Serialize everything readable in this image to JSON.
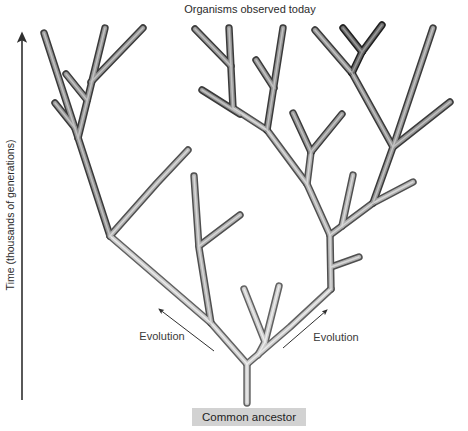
{
  "title": "Organisms observed today",
  "axis_label": "Time (thousands of generations)",
  "labels": {
    "evolution_left": "Evolution",
    "evolution_right": "Evolution",
    "common_ancestor": "Common ancestor"
  },
  "colors": {
    "background": "#ffffff",
    "text": "#2b2b2b",
    "arrow": "#2f2f2f",
    "ancestor_box_bg": "#d2d2d2",
    "tone_outline": [
      "#616161",
      "#4f4f4f",
      "#3a3a3a",
      "#1f1f1f"
    ],
    "tone_fill": [
      "#cccccc",
      "#b2b2b2",
      "#979797",
      "#6a6a6a"
    ],
    "tone_highlight": [
      "#ebebeb",
      "#d8d8d8",
      "#c2c2c2",
      "#9a9a9a"
    ]
  },
  "tree": {
    "segments": [
      {
        "name": "trunk",
        "tone": 0,
        "pts": [
          [
            247,
            403
          ],
          [
            247,
            364
          ]
        ]
      },
      {
        "name": "left-main-branch",
        "tone": 0,
        "pts": [
          [
            247,
            364
          ],
          [
            211,
            323
          ],
          [
            110,
            236
          ]
        ]
      },
      {
        "name": "left-vertical-branch",
        "tone": 1,
        "pts": [
          [
            211,
            323
          ],
          [
            199,
            248
          ],
          [
            194,
            176
          ]
        ]
      },
      {
        "name": "left-vertical-stub",
        "tone": 1,
        "pts": [
          [
            199,
            246
          ],
          [
            240,
            215
          ]
        ]
      },
      {
        "name": "left-steep-branch",
        "tone": 2,
        "pts": [
          [
            110,
            236
          ],
          [
            44,
            33
          ]
        ]
      },
      {
        "name": "left-upper-branch",
        "tone": 2,
        "pts": [
          [
            78,
            138
          ],
          [
            105,
            28
          ]
        ]
      },
      {
        "name": "left-upper-stub",
        "tone": 2,
        "pts": [
          [
            87,
            100
          ],
          [
            66,
            74
          ]
        ]
      },
      {
        "name": "left-top-arm",
        "tone": 2,
        "pts": [
          [
            91,
            82
          ],
          [
            143,
            28
          ]
        ]
      },
      {
        "name": "left-low-stub",
        "tone": 2,
        "pts": [
          [
            75,
            128
          ],
          [
            55,
            103
          ]
        ]
      },
      {
        "name": "left-mid-branch",
        "tone": 1,
        "pts": [
          [
            110,
            236
          ],
          [
            157,
            183
          ],
          [
            188,
            150
          ]
        ]
      },
      {
        "name": "center-spine",
        "tone": 1,
        "pts": [
          [
            330,
            235
          ],
          [
            307,
            184
          ],
          [
            267,
            130
          ],
          [
            233,
            108
          ]
        ]
      },
      {
        "name": "center-vertical",
        "tone": 2,
        "pts": [
          [
            233,
            108
          ],
          [
            229,
            28
          ]
        ]
      },
      {
        "name": "center-left-arm",
        "tone": 2,
        "pts": [
          [
            231,
            66
          ],
          [
            195,
            29
          ]
        ]
      },
      {
        "name": "center-left-arm-2",
        "tone": 2,
        "pts": [
          [
            240,
            114
          ],
          [
            202,
            90
          ]
        ]
      },
      {
        "name": "center-tall-branch",
        "tone": 2,
        "pts": [
          [
            267,
            130
          ],
          [
            283,
            28
          ]
        ]
      },
      {
        "name": "center-tall-stub",
        "tone": 2,
        "pts": [
          [
            274,
            88
          ],
          [
            256,
            60
          ]
        ]
      },
      {
        "name": "center-y-stem",
        "tone": 1,
        "pts": [
          [
            307,
            184
          ],
          [
            311,
            152
          ]
        ]
      },
      {
        "name": "center-y-left",
        "tone": 2,
        "pts": [
          [
            311,
            152
          ],
          [
            293,
            113
          ]
        ]
      },
      {
        "name": "center-y-right",
        "tone": 2,
        "pts": [
          [
            311,
            152
          ],
          [
            342,
            114
          ]
        ]
      },
      {
        "name": "right-main-branch",
        "tone": 0,
        "pts": [
          [
            247,
            364
          ],
          [
            290,
            327
          ],
          [
            331,
            289
          ]
        ]
      },
      {
        "name": "right-v-stem",
        "tone": 0,
        "pts": [
          [
            258,
            355
          ],
          [
            265,
            342
          ]
        ]
      },
      {
        "name": "right-v-left",
        "tone": 0,
        "pts": [
          [
            265,
            342
          ],
          [
            244,
            289
          ]
        ]
      },
      {
        "name": "right-v-right",
        "tone": 0,
        "pts": [
          [
            265,
            342
          ],
          [
            279,
            286
          ]
        ]
      },
      {
        "name": "right-vertical",
        "tone": 1,
        "pts": [
          [
            331,
            289
          ],
          [
            330,
            235
          ]
        ]
      },
      {
        "name": "right-vertical-stub",
        "tone": 1,
        "pts": [
          [
            331,
            267
          ],
          [
            359,
            257
          ]
        ]
      },
      {
        "name": "right-arm",
        "tone": 1,
        "pts": [
          [
            330,
            235
          ],
          [
            373,
            203
          ],
          [
            413,
            182
          ]
        ]
      },
      {
        "name": "right-arm-stub",
        "tone": 1,
        "pts": [
          [
            342,
            226
          ],
          [
            353,
            175
          ]
        ]
      },
      {
        "name": "right-diagonal",
        "tone": 2,
        "pts": [
          [
            373,
            203
          ],
          [
            393,
            147
          ],
          [
            433,
            28
          ]
        ]
      },
      {
        "name": "right-diagonal-arm",
        "tone": 2,
        "pts": [
          [
            393,
            147
          ],
          [
            450,
            102
          ]
        ]
      },
      {
        "name": "right-terminal-branch",
        "tone": 2,
        "pts": [
          [
            393,
            147
          ],
          [
            352,
            73
          ],
          [
            315,
            30
          ]
        ]
      },
      {
        "name": "dark-y-stem",
        "tone": 3,
        "pts": [
          [
            352,
            73
          ],
          [
            362,
            52
          ]
        ]
      },
      {
        "name": "dark-y-left-arm",
        "tone": 3,
        "pts": [
          [
            362,
            52
          ],
          [
            343,
            28
          ]
        ]
      },
      {
        "name": "dark-y-right-arm",
        "tone": 3,
        "pts": [
          [
            362,
            52
          ],
          [
            382,
            25
          ]
        ]
      }
    ]
  },
  "annotations": {
    "time_axis_line": [
      [
        22,
        400
      ],
      [
        22,
        34
      ]
    ],
    "evolution_left_arrow": [
      [
        214,
        351
      ],
      [
        159,
        309
      ]
    ],
    "evolution_right_arrow": [
      [
        283,
        348
      ],
      [
        327,
        310
      ]
    ]
  }
}
